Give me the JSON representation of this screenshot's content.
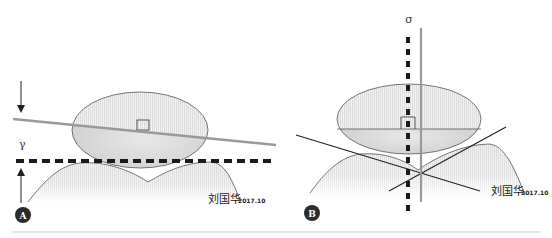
{
  "figure": {
    "panels": [
      {
        "id": "A",
        "badge_label": "A",
        "angle_label": "γ",
        "signature": "刘国华",
        "signature_date": "2017.10"
      },
      {
        "id": "B",
        "badge_label": "B",
        "angle_label": "σ",
        "signature": "刘国华",
        "signature_date": "2017.10"
      }
    ],
    "colors": {
      "outline": "#555555",
      "gray_line": "#999999",
      "dashed_line": "#1a1a1a",
      "black_line": "#222222",
      "badge_fill": "#2b2b2b",
      "rule": "#cccccc"
    }
  }
}
